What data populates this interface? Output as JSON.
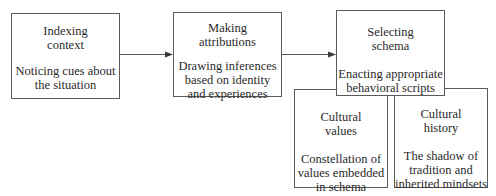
{
  "diagram": {
    "nodes": [
      {
        "id": "indexing",
        "title_lines": [
          "Indexing",
          "context"
        ],
        "title": "Indexing context",
        "description_lines": [
          "Noticing cues about",
          "the situation"
        ],
        "description": "Noticing cues about the situation"
      },
      {
        "id": "attributions",
        "title_lines": [
          "Making",
          "attributions"
        ],
        "title": "Making attributions",
        "description_lines": [
          "Drawing inferences",
          "based on identity",
          "and experiences"
        ],
        "description": "Drawing inferences based on identity and experiences"
      },
      {
        "id": "schema",
        "title_lines": [
          "Selecting",
          "schema"
        ],
        "title": "Selecting schema",
        "description_lines": [
          "Enacting appropriate",
          "behavioral scripts"
        ],
        "description": "Enacting appropriate behavioral scripts"
      },
      {
        "id": "values",
        "title_lines": [
          "Cultural",
          "values"
        ],
        "title": "Cultural values",
        "description_lines": [
          "Constellation of",
          "values embedded",
          "in schema"
        ],
        "description": "Constellation of values embedded in schema"
      },
      {
        "id": "history",
        "title_lines": [
          "Cultural",
          "history"
        ],
        "title": "Cultural history",
        "description_lines": [
          "The shadow of",
          "tradition and",
          "inherited mindsets"
        ],
        "description": "The shadow of tradition and inherited mindsets"
      }
    ],
    "edges": [
      {
        "from": "indexing",
        "to": "attributions",
        "type": "arrow"
      },
      {
        "from": "attributions",
        "to": "schema",
        "type": "arrow"
      }
    ],
    "colors": {
      "border": "#5a5a5a",
      "text": "#2a2a2a",
      "background": "#ffffff"
    }
  }
}
